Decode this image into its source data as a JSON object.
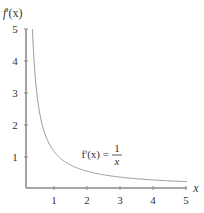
{
  "chart_data": {
    "type": "line",
    "title": "",
    "xlabel": "x",
    "ylabel": "f'(x)",
    "xlim": [
      0,
      5
    ],
    "ylim": [
      0,
      5
    ],
    "x_ticks": [
      1,
      2,
      3,
      4,
      5
    ],
    "y_ticks": [
      1,
      2,
      3,
      4,
      5
    ],
    "grid": false,
    "legend": null,
    "series": [
      {
        "name": "f'(x) = 1/x",
        "function": "1/x",
        "x": [
          0.2,
          0.25,
          0.3,
          0.4,
          0.5,
          0.75,
          1,
          1.5,
          2,
          2.5,
          3,
          3.5,
          4,
          4.5,
          5
        ],
        "y": [
          5,
          4,
          3.333,
          2.5,
          2,
          1.333,
          1,
          0.667,
          0.5,
          0.4,
          0.333,
          0.286,
          0.25,
          0.222,
          0.2
        ]
      }
    ],
    "annotations": [
      {
        "text_lhs": "f'(x) =",
        "numerator": "1",
        "denominator": "x",
        "x": 3.1,
        "y": 1.05
      }
    ]
  },
  "labels": {
    "x_axis": "x",
    "y_axis_f": "f",
    "y_axis_rest": "'(x)",
    "x_ticks": [
      "1",
      "2",
      "3",
      "4",
      "5"
    ],
    "y_ticks": [
      "1",
      "2",
      "3",
      "4",
      "5"
    ],
    "annotation_lhs": "f'(x) =",
    "annotation_num": "1",
    "annotation_den": "x"
  },
  "colors": {
    "axis": "#8a8a8a",
    "curve": "#9a9a9a",
    "text": "#333333"
  }
}
